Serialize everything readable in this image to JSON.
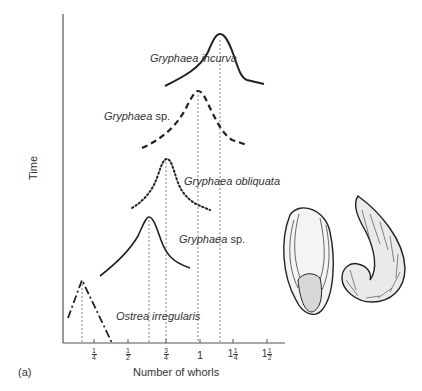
{
  "figure": {
    "panel_label": "(a)",
    "y_axis_label": "Time",
    "x_axis_label": "Number of whorls",
    "x_ticks": [
      {
        "whole": "",
        "num": "1",
        "den": "4",
        "x": 94
      },
      {
        "whole": "",
        "num": "1",
        "den": "2",
        "x": 128
      },
      {
        "whole": "",
        "num": "3",
        "den": "4",
        "x": 166
      },
      {
        "whole": "1",
        "num": "",
        "den": "",
        "x": 200
      },
      {
        "whole": "1",
        "num": "1",
        "den": "4",
        "x": 233
      },
      {
        "whole": "1",
        "num": "1",
        "den": "2",
        "x": 267
      }
    ],
    "curves": [
      {
        "name": "Gryphaea incurva",
        "genus": "Gryphaea",
        "species": "incurva",
        "style": "solid",
        "peak_whorls": 1.3
      },
      {
        "name": "Gryphaea sp.",
        "genus": "Gryphaea",
        "species": "sp.",
        "style": "dashed",
        "peak_whorls": 0.98
      },
      {
        "name": "Gryphaea obliquata",
        "genus": "Gryphaea",
        "species": "obliquata",
        "style": "dotted",
        "peak_whorls": 0.76
      },
      {
        "name": "Gryphaea sp.",
        "genus": "Gryphaea",
        "species": "sp.",
        "style": "solid",
        "peak_whorls": 0.64
      },
      {
        "name": "Ostrea irregularis",
        "genus": "Ostrea",
        "species": "irregularis",
        "style": "dash-dot",
        "peak_whorls": 0.14
      }
    ],
    "illustration": "two oyster shell drawings (Gryphaea)"
  }
}
